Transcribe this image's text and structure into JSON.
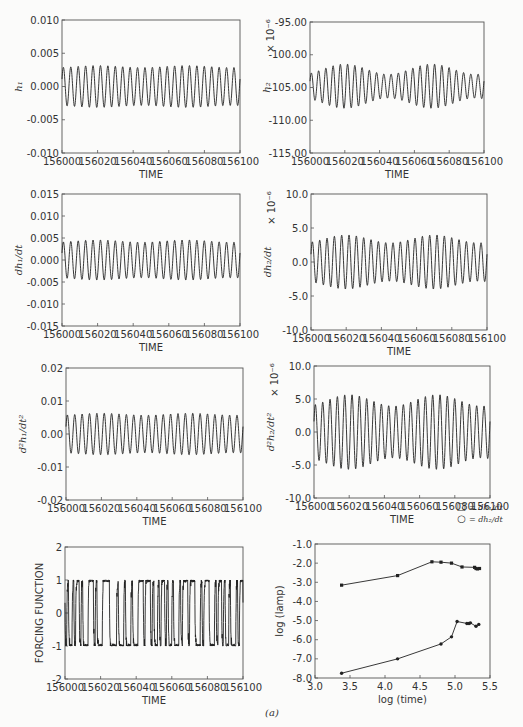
{
  "figure_label": "(a)",
  "chart_data": [
    {
      "id": "h1",
      "type": "line",
      "title": "",
      "xlabel": "TIME",
      "ylabel": "h_1",
      "ylabel_display": "h₁",
      "xlim": [
        156000,
        156100
      ],
      "ylim": [
        -0.01,
        0.01
      ],
      "xticks": [
        "156000",
        "156020",
        "156040",
        "156060",
        "156080",
        "156100"
      ],
      "yticks": [
        "0.010",
        "0.005",
        "0.000",
        "-0.005",
        "-0.010"
      ],
      "yticks_values": [
        0.01,
        0.005,
        0.0,
        -0.005,
        -0.01
      ],
      "series": [
        {
          "name": "h1",
          "kind": "sinusoid",
          "cycles": 24,
          "amplitude": 0.003,
          "offset": 0.0,
          "amplitude_modulation": 0.05
        }
      ],
      "frame": {
        "x": 62,
        "y": 20,
        "w": 178,
        "h": 133
      }
    },
    {
      "id": "h2",
      "type": "line",
      "title": "",
      "xlabel": "TIME",
      "ylabel": "h_2",
      "ylabel_display": "h₂",
      "scale_note": "× 10⁻⁶",
      "xlim": [
        156000,
        156100
      ],
      "ylim": [
        -115.0,
        -95.0
      ],
      "xticks": [
        "156000",
        "156020",
        "156040",
        "156060",
        "156080",
        "156100"
      ],
      "yticks": [
        "-95.00",
        "-100.00",
        "-105.00",
        "-110.00",
        "-115.00"
      ],
      "yticks_values": [
        -95,
        -100,
        -105,
        -110,
        -115
      ],
      "series": [
        {
          "name": "h2",
          "kind": "sinusoid",
          "cycles": 24,
          "amplitude": 2.6,
          "offset": -104.8,
          "amplitude_modulation": 0.3
        }
      ],
      "frame": {
        "x": 310,
        "y": 22,
        "w": 174,
        "h": 131
      }
    },
    {
      "id": "dh1dt",
      "type": "line",
      "title": "",
      "xlabel": "TIME",
      "ylabel": "dh_1/dt",
      "ylabel_display": "dh₁/dt",
      "xlim": [
        156000,
        156100
      ],
      "ylim": [
        -0.015,
        0.015
      ],
      "xticks": [
        "156000",
        "156020",
        "156040",
        "156060",
        "156080",
        "156100"
      ],
      "yticks": [
        "0.015",
        "0.010",
        "0.005",
        "0.000",
        "-0.005",
        "-0.010",
        "-0.015"
      ],
      "yticks_values": [
        0.015,
        0.01,
        0.005,
        0.0,
        -0.005,
        -0.01,
        -0.015
      ],
      "series": [
        {
          "name": "dh1/dt",
          "kind": "sinusoid",
          "cycles": 24,
          "amplitude": 0.0043,
          "offset": 0.0,
          "amplitude_modulation": 0.06
        }
      ],
      "frame": {
        "x": 62,
        "y": 194,
        "w": 178,
        "h": 132
      }
    },
    {
      "id": "dh2dt",
      "type": "line",
      "title": "",
      "xlabel": "TIME",
      "ylabel": "dh_2/dt",
      "ylabel_display": "dh₂/dt",
      "scale_note": "× 10⁻⁶",
      "xlim": [
        156000,
        156100
      ],
      "ylim": [
        -10.0,
        10.0
      ],
      "xticks": [
        "156000",
        "156020",
        "156040",
        "156060",
        "156080",
        "156100"
      ],
      "yticks": [
        "10.0",
        "5.0",
        "0.0",
        "-5.0",
        "-10.0"
      ],
      "yticks_values": [
        10,
        5,
        0,
        -5,
        -10
      ],
      "series": [
        {
          "name": "dh2/dt",
          "kind": "sinusoid",
          "cycles": 24,
          "amplitude": 3.4,
          "offset": 0.0,
          "amplitude_modulation": 0.17
        }
      ],
      "frame": {
        "x": 311,
        "y": 194,
        "w": 176,
        "h": 136
      }
    },
    {
      "id": "d2h1dt2",
      "type": "line",
      "title": "",
      "xlabel": "TIME",
      "ylabel": "d^2h_1/dt^2",
      "ylabel_display": "d²h₁/dt²",
      "xlim": [
        156000,
        156100
      ],
      "ylim": [
        -0.02,
        0.02
      ],
      "xticks": [
        "156000",
        "156020",
        "156040",
        "156060",
        "156080",
        "156100"
      ],
      "yticks": [
        "0.02",
        "0.01",
        "0.00",
        "-0.01",
        "-0.02"
      ],
      "yticks_values": [
        0.02,
        0.01,
        0.0,
        -0.01,
        -0.02
      ],
      "series": [
        {
          "name": "d2h1/dt2",
          "kind": "sinusoid",
          "cycles": 24,
          "amplitude": 0.006,
          "offset": 0.0,
          "amplitude_modulation": 0.05
        }
      ],
      "frame": {
        "x": 66,
        "y": 368,
        "w": 177,
        "h": 132
      }
    },
    {
      "id": "d2h2dt2",
      "type": "line",
      "title": "",
      "xlabel": "TIME",
      "ylabel": "d^2h_2/dt^2",
      "ylabel_display": "d²h₂/dt²",
      "scale_note": "× 10⁻⁶",
      "xlim": [
        156000,
        156100
      ],
      "ylim": [
        -10.0,
        10.0
      ],
      "xticks": [
        "156000",
        "156020",
        "156040",
        "156060",
        "156080",
        "156100"
      ],
      "yticks": [
        "10.0",
        "5.0",
        "0.0",
        "-5.0",
        "-10.0"
      ],
      "yticks_values": [
        10,
        5,
        0,
        -5,
        -10
      ],
      "series": [
        {
          "name": "d2h2/dt2",
          "kind": "sinusoid",
          "cycles": 24,
          "amplitude": 4.8,
          "offset": 0.0,
          "amplitude_modulation": 0.18
        }
      ],
      "frame": {
        "x": 314,
        "y": 366,
        "w": 176,
        "h": 132
      }
    },
    {
      "id": "forcing",
      "type": "line",
      "title": "",
      "xlabel": "TIME",
      "ylabel": "FORCING FUNCTION",
      "xlim": [
        156000,
        156100
      ],
      "ylim": [
        -2,
        2
      ],
      "xticks": [
        "156000",
        "156020",
        "156040",
        "156060",
        "156080",
        "156100"
      ],
      "yticks": [
        "2",
        "1",
        "0",
        "-1",
        "-2"
      ],
      "yticks_values": [
        2,
        1,
        0,
        -1,
        -2
      ],
      "series": [
        {
          "name": "forcing",
          "kind": "square-ish chaotic switching between -1 and 1",
          "cycles": 25
        }
      ],
      "frame": {
        "x": 65,
        "y": 547,
        "w": 178,
        "h": 132
      }
    },
    {
      "id": "log_amp",
      "type": "line",
      "title": "",
      "xlabel": "log (time)",
      "ylabel": "log (lamp)",
      "xlim": [
        3.0,
        5.5
      ],
      "ylim": [
        -8.0,
        -1.0
      ],
      "xticks": [
        "3.0",
        "3.5",
        "4.0",
        "4.5",
        "5.0",
        "5.5"
      ],
      "xticks_values": [
        3.0,
        3.5,
        4.0,
        4.5,
        5.0,
        5.5
      ],
      "yticks": [
        "-1.0",
        "-2.0",
        "-3.0",
        "-4.0",
        "-5.0",
        "-6.0",
        "-7.0",
        "-8.0"
      ],
      "yticks_values": [
        -1,
        -2,
        -3,
        -4,
        -5,
        -6,
        -7,
        -8
      ],
      "legend": [
        {
          "marker": "□",
          "label": "= dh₁/dt"
        },
        {
          "marker": "○",
          "label": "= dh₂/dt"
        }
      ],
      "legend_position": "above-right",
      "series": [
        {
          "name": "dh1/dt",
          "marker": "square",
          "x": [
            3.38,
            4.18,
            4.67,
            4.8,
            4.95,
            5.1,
            5.28,
            5.3,
            5.32,
            5.35
          ],
          "y": [
            -3.15,
            -2.65,
            -1.93,
            -1.95,
            -2.0,
            -2.2,
            -2.22,
            -2.28,
            -2.3,
            -2.28
          ]
        },
        {
          "name": "dh2/dt",
          "marker": "circle",
          "x": [
            3.38,
            4.18,
            4.8,
            4.95,
            5.03,
            5.17,
            5.2,
            5.22,
            5.3,
            5.34
          ],
          "y": [
            -7.75,
            -7.0,
            -6.22,
            -5.85,
            -5.05,
            -5.15,
            -5.15,
            -5.12,
            -5.3,
            -5.2
          ]
        }
      ],
      "frame": {
        "x": 315,
        "y": 544,
        "w": 175,
        "h": 134
      }
    }
  ]
}
